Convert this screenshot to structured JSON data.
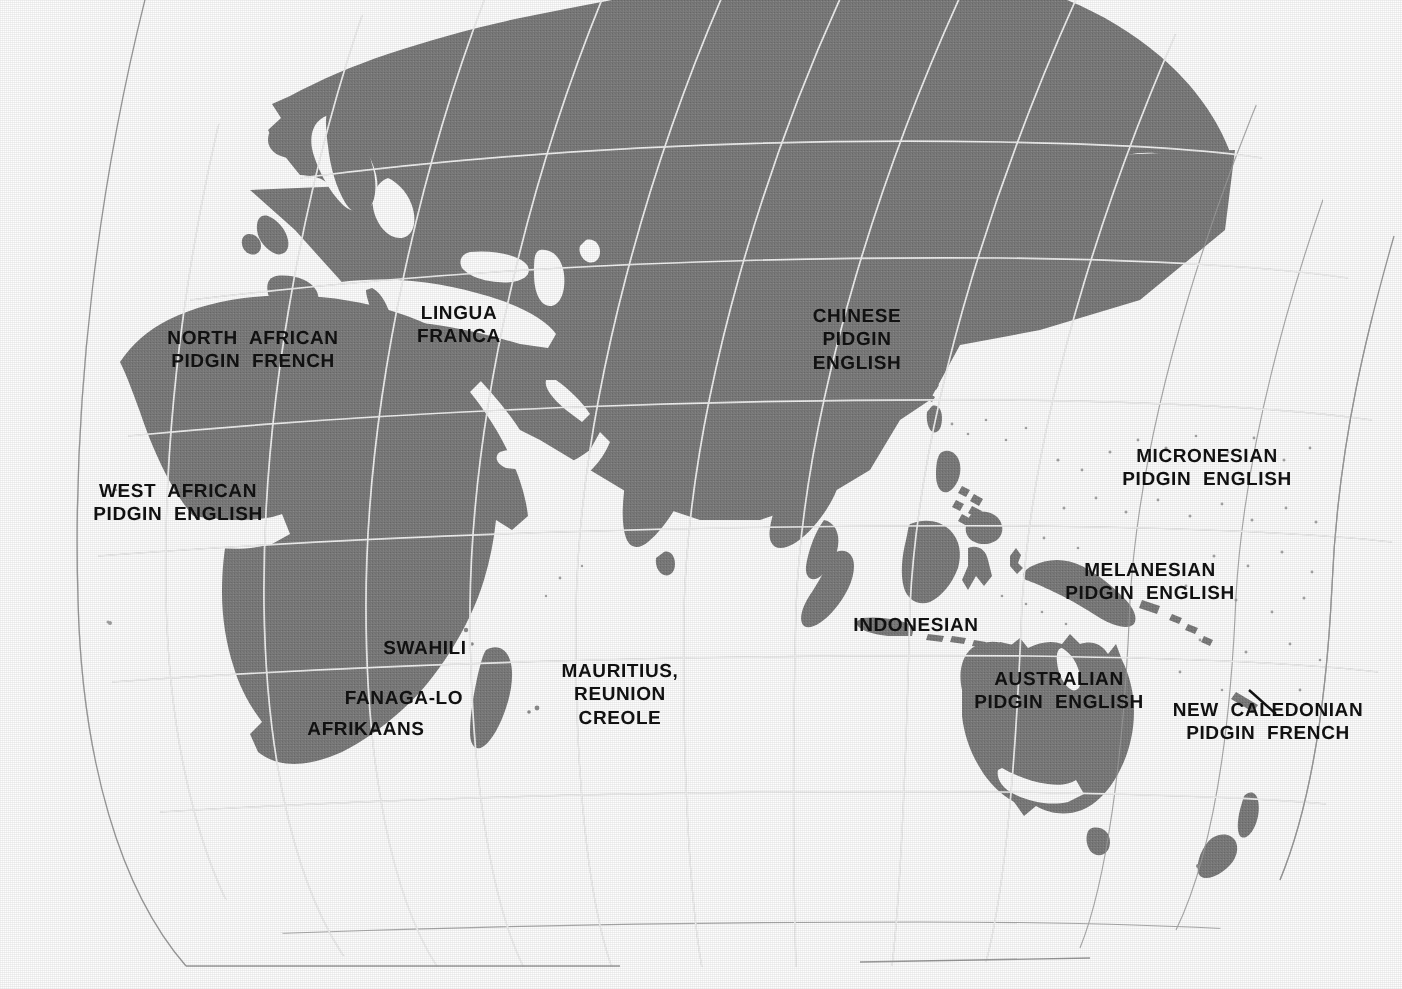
{
  "map": {
    "title": "Pidgin and Creole languages of the Eastern Hemisphere",
    "projection": "oval world projection (Eastern Hemisphere detail)",
    "land_color": "#7c7c7c",
    "ocean_color": "#fdfdfd",
    "graticule_land_color": "#f2f2f2",
    "graticule_ocean_color": "#9a9a9a",
    "label_color": "#111111"
  },
  "labels": [
    {
      "id": "north-african-pidgin-french",
      "lines": [
        "NORTH  AFRICAN",
        "PIDGIN  FRENCH"
      ],
      "x": 253,
      "y": 350,
      "size": 19,
      "align": "center"
    },
    {
      "id": "lingua-franca",
      "lines": [
        "LINGUA",
        "FRANCA"
      ],
      "x": 459,
      "y": 325,
      "size": 19,
      "align": "center"
    },
    {
      "id": "west-african-pidgin-english",
      "lines": [
        "WEST  AFRICAN",
        "PIDGIN  ENGLISH"
      ],
      "x": 178,
      "y": 503,
      "size": 19,
      "align": "center"
    },
    {
      "id": "chinese-pidgin-english",
      "lines": [
        "CHINESE",
        "PIDGIN",
        "ENGLISH"
      ],
      "x": 857,
      "y": 340,
      "size": 19,
      "align": "center"
    },
    {
      "id": "micronesian-pidgin-english",
      "lines": [
        "MICRONESIAN",
        "PIDGIN  ENGLISH"
      ],
      "x": 1207,
      "y": 468,
      "size": 19,
      "align": "center"
    },
    {
      "id": "melanesian-pidgin-english",
      "lines": [
        "MELANESIAN",
        "PIDGIN  ENGLISH"
      ],
      "x": 1150,
      "y": 582,
      "size": 19,
      "align": "center"
    },
    {
      "id": "indonesian",
      "lines": [
        "INDONESIAN"
      ],
      "x": 916,
      "y": 626,
      "size": 19,
      "align": "center"
    },
    {
      "id": "swahili",
      "lines": [
        "SWAHILI"
      ],
      "x": 425,
      "y": 649,
      "size": 19,
      "align": "center"
    },
    {
      "id": "fanaga-lo",
      "lines": [
        "FANAGA-LO"
      ],
      "x": 404,
      "y": 699,
      "size": 19,
      "align": "center"
    },
    {
      "id": "afrikaans",
      "lines": [
        "AFRIKAANS"
      ],
      "x": 366,
      "y": 730,
      "size": 19,
      "align": "center"
    },
    {
      "id": "mauritius-reunion-creole",
      "lines": [
        "MAURITIUS,",
        "REUNION",
        "CREOLE"
      ],
      "x": 620,
      "y": 695,
      "size": 19,
      "align": "center"
    },
    {
      "id": "australian-pidgin-english",
      "lines": [
        "AUSTRALIAN",
        "PIDGIN  ENGLISH"
      ],
      "x": 1059,
      "y": 691,
      "size": 19,
      "align": "center"
    },
    {
      "id": "new-caledonian-pidgin-french",
      "lines": [
        "NEW  CALEDONIAN",
        "PIDGIN  FRENCH"
      ],
      "x": 1268,
      "y": 722,
      "size": 19,
      "align": "center"
    }
  ],
  "leader_lines": [
    {
      "id": "new-caledonia-leader",
      "x1": 1250,
      "y1": 690,
      "x2": 1275,
      "y2": 713
    }
  ]
}
